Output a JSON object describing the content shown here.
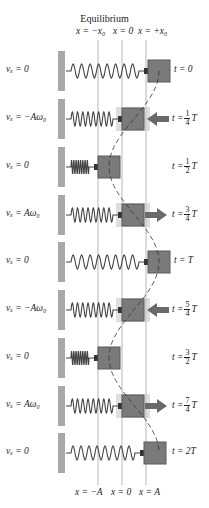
{
  "header": {
    "title": "Equilibrium",
    "top_positions": [
      "x = −x₀",
      "x = 0",
      "x = +x₀"
    ]
  },
  "footer": {
    "bottom_positions": [
      "x = −A",
      "x = 0",
      "x = A"
    ]
  },
  "colors": {
    "wall": "#a8a8a8",
    "block": "#7a7a7a",
    "block_border": "#5a5a5a",
    "arrow": "#6a6a6a",
    "ghost": "#c8c8c8",
    "spring": "#444444",
    "guide": "#999999"
  },
  "rows": [
    {
      "v": "vₓ = 0",
      "t_prefix": "t = 0",
      "t_frac": null,
      "t_suffix": "",
      "block_x": 148,
      "arrow": "none"
    },
    {
      "v": "vₓ = −Aω₀",
      "t_prefix": "t =",
      "t_frac": [
        "1",
        "4"
      ],
      "t_suffix": "T",
      "block_x": 122,
      "arrow": "left"
    },
    {
      "v": "vₓ = 0",
      "t_prefix": "t =",
      "t_frac": [
        "1",
        "2"
      ],
      "t_suffix": "T",
      "block_x": 98,
      "arrow": "none"
    },
    {
      "v": "vₓ = Aω₀",
      "t_prefix": "t =",
      "t_frac": [
        "3",
        "4"
      ],
      "t_suffix": "T",
      "block_x": 122,
      "arrow": "right"
    },
    {
      "v": "vₓ = 0",
      "t_prefix": "t = T",
      "t_frac": null,
      "t_suffix": "",
      "block_x": 148,
      "arrow": "none"
    },
    {
      "v": "vₓ = −Aω₀",
      "t_prefix": "t =",
      "t_frac": [
        "5",
        "4"
      ],
      "t_suffix": "T",
      "block_x": 122,
      "arrow": "left"
    },
    {
      "v": "vₓ = 0",
      "t_prefix": "t =",
      "t_frac": [
        "3",
        "2"
      ],
      "t_suffix": "T",
      "block_x": 98,
      "arrow": "none"
    },
    {
      "v": "vₓ = Aω₀",
      "t_prefix": "t =",
      "t_frac": [
        "7",
        "4"
      ],
      "t_suffix": "T",
      "block_x": 122,
      "arrow": "right"
    },
    {
      "v": "vₓ = 0",
      "t_prefix": "t = 2T",
      "t_frac": null,
      "t_suffix": "",
      "block_x": 144,
      "arrow": "none"
    }
  ]
}
